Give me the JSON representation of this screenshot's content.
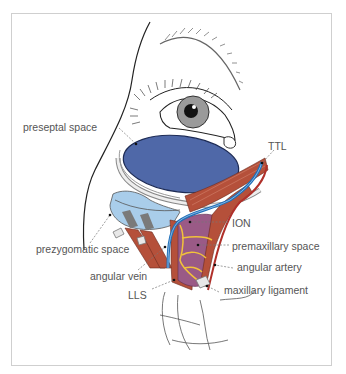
{
  "figure": {
    "labels": {
      "preseptal_space": "preseptal space",
      "ttl": "TTL",
      "ion": "ION",
      "prezygomatic_space": "prezygomatic space",
      "premaxillary_space": "premaxillary space",
      "angular_vein": "angular vein",
      "angular_artery": "angular artery",
      "lls": "LLS",
      "maxillary_ligament": "maxillary ligament"
    },
    "colors": {
      "preseptal_space": "#4f68a8",
      "prezygomatic_space": "#a9cdea",
      "muscle": "#b5503a",
      "premaxillary_space": "#9a5a86",
      "angular_vein": "#1f6fb8",
      "angular_artery": "#b0302a",
      "nerve": "#f2c23a",
      "ligament": "#7a7a7a",
      "label_text": "#555555",
      "frame": "#cfcfcf"
    }
  }
}
